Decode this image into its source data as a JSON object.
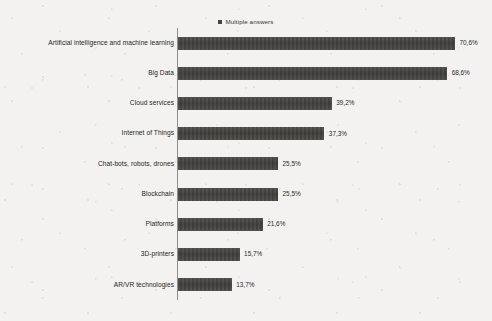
{
  "legend": {
    "marker_icon": "legend-square-marker",
    "label": "Multiple answers",
    "position": "top-center",
    "color": "#46443f"
  },
  "chart_data": {
    "type": "bar",
    "orientation": "horizontal",
    "title": "",
    "subtitle": "",
    "xlabel": "",
    "ylabel": "",
    "grid": false,
    "legend_position": "top-center",
    "axis_visible": true,
    "value_suffix": "%",
    "decimal_separator": ",",
    "xlim": [
      0,
      70.6
    ],
    "categories": [
      "Artificial intelligence and machine learning",
      "Big Data",
      "Cloud services",
      "Internet of Things",
      "Chat-bots, robots, drones",
      "Blockchain",
      "Platforms",
      "3D-printers",
      "AR/VR technologies"
    ],
    "values": [
      70.6,
      68.6,
      39.2,
      37.3,
      25.5,
      25.5,
      21.6,
      15.7,
      13.7
    ],
    "value_labels": [
      "70,6%",
      "68,6%",
      "39,2%",
      "37,3%",
      "25,5%",
      "25,5%",
      "21,6%",
      "15,7%",
      "13,7%"
    ],
    "series": [
      {
        "name": "Multiple answers",
        "color": "#464440",
        "values": [
          70.6,
          68.6,
          39.2,
          37.3,
          25.5,
          25.5,
          21.6,
          15.7,
          13.7
        ]
      }
    ]
  },
  "colors": {
    "background": "#f3f2f0",
    "bar": "#464440",
    "axis": "#8e8c88",
    "text": "#272521"
  }
}
